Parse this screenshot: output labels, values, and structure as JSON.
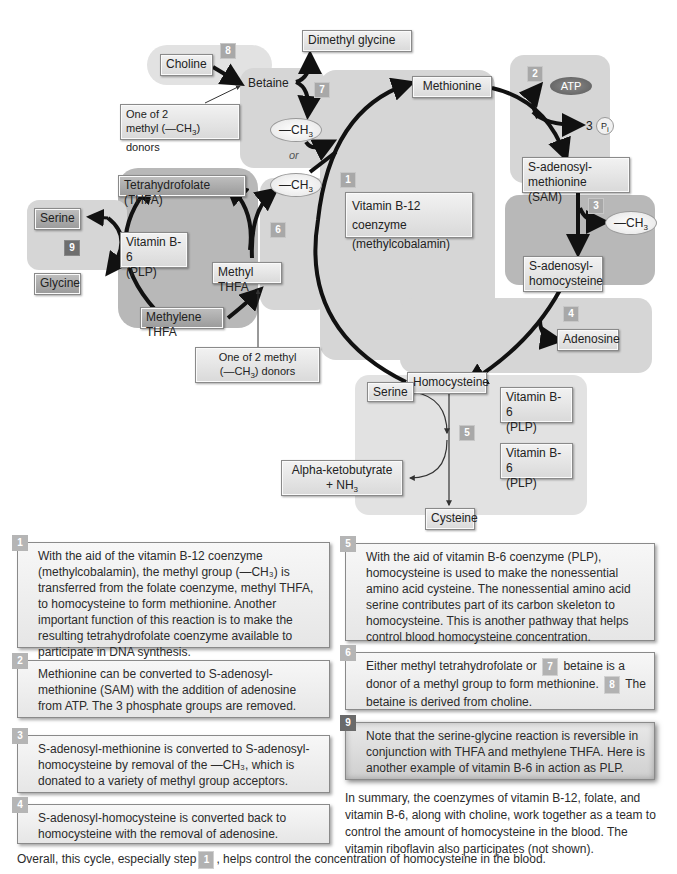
{
  "diagram": {
    "nodes": {
      "choline": "Choline",
      "betaine": "Betaine",
      "dimethyl_glycine": "Dimethyl glycine",
      "methyl_donor_note_top_line1": "One of 2",
      "methyl_donor_note_top_line2": "methyl (—CH",
      "methyl_donor_note_top_line2_sub": "3",
      "methyl_donor_note_top_line2_end": ") donors",
      "ch3": "—CH",
      "ch3_sub": "3",
      "or": "or",
      "methionine": "Methionine",
      "atp": "ATP",
      "three": "3",
      "pi": "P",
      "pi_sub": "i",
      "sam_line1": "S-adenosyl-",
      "sam_line2": "methionine (SAM)",
      "sah_line1": "S-adenosyl-",
      "sah_line2": "homocysteine",
      "adenosine": "Adenosine",
      "homocysteine": "Homocysteine",
      "b12_line1": "Vitamin B-12 coenzyme",
      "b12_line2": "(methylcobalamin)",
      "thfa": "Tetrahydrofolate (THFA)",
      "b6_left_line1": "Vitamin B-6",
      "b6_left_line2": "(PLP)",
      "methyl_thfa": "Methyl THFA",
      "methylene_thfa": "Methylene THFA",
      "serine_left": "Serine",
      "glycine": "Glycine",
      "methyl_donor_note_bottom_line1": "One of 2 methyl",
      "methyl_donor_note_bottom_line2": "(—CH",
      "methyl_donor_note_bottom_line2_sub": "3",
      "methyl_donor_note_bottom_line2_end": ") donors",
      "serine_bottom": "Serine",
      "b6_right1_line1": "Vitamin B-6",
      "b6_right1_line2": "(PLP)",
      "b6_right2_line1": "Vitamin B-6",
      "b6_right2_line2": "(PLP)",
      "alpha_line1": "Alpha-ketobutyrate",
      "alpha_line2": "+ NH",
      "alpha_line2_sub": "3",
      "cysteine": "Cysteine"
    },
    "step_badges": [
      "1",
      "2",
      "3",
      "4",
      "5",
      "6",
      "7",
      "8",
      "9"
    ]
  },
  "notes": [
    {
      "step": "1",
      "text": "With the aid of the vitamin B-12 coenzyme (methylcobalamin), the methyl group (—CH₃) is transferred from the folate coenzyme, methyl THFA, to homocysteine to form methionine. Another important function of this reaction is to make the resulting tetrahydrofolate coenzyme available to participate in DNA synthesis."
    },
    {
      "step": "2",
      "text": "Methionine can be converted to S-adenosyl-methionine (SAM) with the addition of adenosine from ATP. The 3 phosphate groups are removed."
    },
    {
      "step": "3",
      "text": "S-adenosyl-methionine is converted to S-adenosyl-homocysteine by removal of the —CH₃, which is donated to a variety of methyl group acceptors."
    },
    {
      "step": "4",
      "text": "S-adenosyl-homocysteine is converted back to homocysteine with the removal of adenosine."
    },
    {
      "step": "5",
      "text": "With the aid of vitamin B-6 coenzyme (PLP), homocysteine is used to make the nonessential amino acid cysteine. The nonessential amino acid serine contributes part of its carbon skeleton to homocysteine. This is another pathway that helps control blood homocysteine concentration."
    },
    {
      "step": "6",
      "text_a": "Either methyl tetrahydrofolate or",
      "badge_a": "7",
      "text_b": "betaine is a donor of a methyl group to form methionine.",
      "badge_b": "8",
      "text_c": "The betaine is derived from choline."
    },
    {
      "step": "9",
      "text": "Note that the serine-glycine reaction is reversible in conjunction with THFA and methylene THFA. Here is another example of vitamin B-6 in action as PLP."
    }
  ],
  "summary": "In summary, the coenzymes of vitamin B-12, folate, and vitamin B-6, along with choline, work together as a team to control the amount of homocysteine in the blood. The vitamin riboflavin also participates (not shown).",
  "footer": {
    "text_a": "Overall, this cycle, especially step",
    "badge": "1",
    "text_b": ", helps control the concentration of homocysteine in the blood."
  }
}
